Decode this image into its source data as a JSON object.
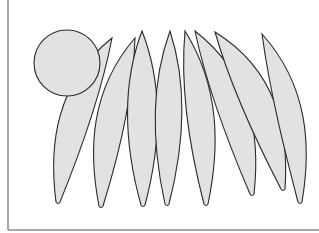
{
  "figure": {
    "fill_color": "#e2e2e2",
    "stroke_color": "#2a2a2a",
    "frame_color": "#8a8a8a",
    "shapes": {
      "circle_count": 1,
      "leaf_count": 8
    }
  }
}
